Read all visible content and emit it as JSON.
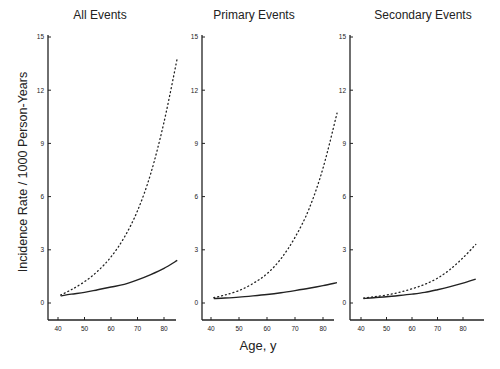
{
  "chart_data": {
    "type": "line",
    "ylabel": "Incidence Rate / 1000 Person-Years",
    "xlabel": "Age, y",
    "ylim": [
      -1.2,
      15
    ],
    "xlim": [
      35,
      87
    ],
    "yticks": [
      0,
      3,
      6,
      9,
      12,
      15
    ],
    "yticklabels": [
      "0",
      "3",
      "6",
      "9",
      "12",
      "15"
    ],
    "xticks": [
      40,
      50,
      60,
      70,
      80
    ],
    "xticklabels": [
      "40",
      "50",
      "60",
      "70",
      "80"
    ],
    "grid": false,
    "legend": "none",
    "panels": [
      {
        "title": "All Events",
        "x": [
          41,
          45,
          50,
          55,
          60,
          65,
          70,
          75,
          80,
          85
        ],
        "series": [
          {
            "name": "solid",
            "style": "solid",
            "values": [
              0.4,
              0.5,
              0.6,
              0.75,
              0.9,
              1.05,
              1.3,
              1.6,
              1.95,
              2.4
            ]
          },
          {
            "name": "dotted",
            "style": "dotted",
            "values": [
              0.45,
              0.75,
              1.2,
              1.8,
              2.6,
              3.7,
              5.2,
              7.3,
              10.2,
              13.8
            ]
          }
        ]
      },
      {
        "title": "Primary Events",
        "x": [
          41,
          45,
          50,
          55,
          60,
          65,
          70,
          75,
          80,
          85
        ],
        "series": [
          {
            "name": "solid",
            "style": "solid",
            "values": [
              0.25,
              0.28,
              0.33,
              0.4,
              0.48,
              0.58,
              0.7,
              0.83,
              0.98,
              1.15
            ]
          },
          {
            "name": "dotted",
            "style": "dotted",
            "values": [
              0.3,
              0.45,
              0.7,
              1.1,
              1.65,
              2.5,
              3.7,
              5.3,
              7.6,
              10.7
            ]
          }
        ]
      },
      {
        "title": "Secondary Events",
        "x": [
          41,
          45,
          50,
          55,
          60,
          65,
          70,
          75,
          80,
          85
        ],
        "series": [
          {
            "name": "solid",
            "style": "solid",
            "values": [
              0.25,
              0.3,
              0.35,
              0.42,
              0.5,
              0.6,
              0.75,
              0.92,
              1.12,
              1.35
            ]
          },
          {
            "name": "dotted",
            "style": "dotted",
            "values": [
              0.28,
              0.35,
              0.45,
              0.6,
              0.8,
              1.05,
              1.4,
              1.9,
              2.55,
              3.3
            ]
          }
        ]
      }
    ]
  }
}
